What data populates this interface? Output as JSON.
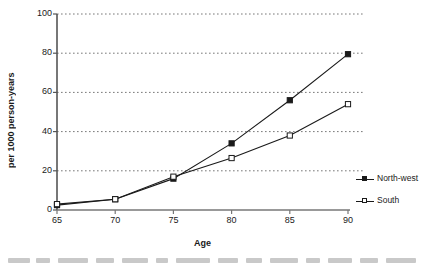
{
  "chart_data": {
    "type": "line",
    "title": "",
    "xlabel": "Age",
    "ylabel": "per 1000 person-years",
    "categories": [
      65,
      70,
      75,
      80,
      85,
      90
    ],
    "xtick_labels": [
      "65",
      "70",
      "75",
      "80",
      "85",
      "90"
    ],
    "ytick_labels": [
      "0",
      "20",
      "40",
      "60",
      "80",
      "100"
    ],
    "yticks": [
      0,
      20,
      40,
      60,
      80,
      100
    ],
    "ylim": [
      0,
      100
    ],
    "grid": "horizontal-dotted",
    "legend_position": "right",
    "series": [
      {
        "name": "North-west",
        "marker": "filled-square",
        "color": "#1a1a1a",
        "values": [
          2.5,
          5.5,
          16,
          34,
          56,
          79.5
        ]
      },
      {
        "name": "South",
        "marker": "open-square",
        "color": "#1a1a1a",
        "values": [
          3,
          5.5,
          17,
          26.5,
          38,
          54
        ]
      }
    ]
  },
  "legend": {
    "items": [
      {
        "label": "North-west"
      },
      {
        "label": "South"
      }
    ]
  },
  "axes": {
    "y_title": "per 1000 person-years",
    "x_title": "Age"
  }
}
